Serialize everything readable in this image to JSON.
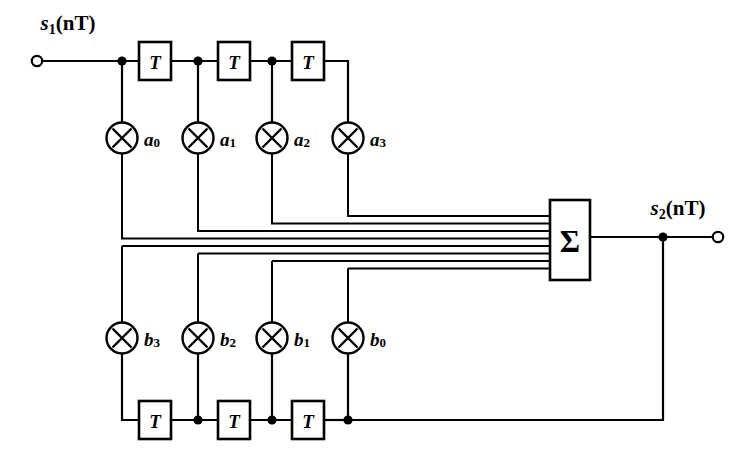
{
  "diagram": {
    "input_label": {
      "base": "s",
      "sub": "1",
      "arg": "(nT)"
    },
    "output_label": {
      "base": "s",
      "sub": "2",
      "arg": "(nT)"
    },
    "delay_block_label": "T",
    "summer_label": "Σ",
    "multiplier_glyph": "⊗",
    "colors": {
      "line": "#000000",
      "fill": "#ffffff",
      "background": "#ffffff"
    },
    "feedforward_coefficients": [
      {
        "base": "a",
        "sub": "0"
      },
      {
        "base": "a",
        "sub": "1"
      },
      {
        "base": "a",
        "sub": "2"
      },
      {
        "base": "a",
        "sub": "3"
      }
    ],
    "feedback_coefficients": [
      {
        "base": "b",
        "sub": "3"
      },
      {
        "base": "b",
        "sub": "2"
      },
      {
        "base": "b",
        "sub": "1"
      },
      {
        "base": "b",
        "sub": "0"
      }
    ],
    "top_delay_count": 3,
    "bottom_delay_count": 3,
    "summer_input_count": 8
  }
}
